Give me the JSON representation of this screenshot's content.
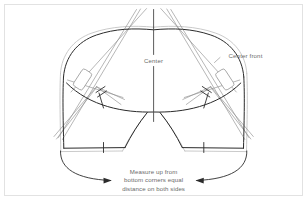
{
  "figure": {
    "background_color": "#ffffff",
    "frame_color": "#e2e2e2",
    "seam_line_color": "#2b2b2b",
    "allowance_line_color": "#b9b9b9",
    "guide_line_color": "#8a8a8a",
    "text_color": "#6b6b6b"
  },
  "labels": {
    "center": "Center",
    "center_front": "Center front",
    "note_line_1": "Measure up from",
    "note_line_2": "bottom corners equal",
    "note_line_3": "distance on both sides"
  },
  "markers": {
    "left_dart_box": "dart-box-left",
    "right_dart_box": "dart-box-right",
    "notch_count": 6
  },
  "annotations": {
    "arrow_left": "curved-arrow-left",
    "arrow_right": "curved-arrow-right",
    "center_axis": "vertical-center-axis"
  }
}
